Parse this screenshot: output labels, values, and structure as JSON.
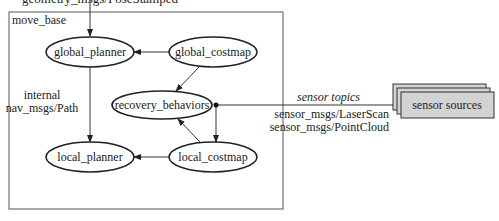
{
  "container": {
    "label": "move_base"
  },
  "top_input": {
    "label": "geometry_msgs/PoseStamped"
  },
  "nodes": {
    "global_planner": "global_planner",
    "global_costmap": "global_costmap",
    "recovery_behaviors": "recovery_behaviors",
    "local_planner": "local_planner",
    "local_costmap": "local_costmap"
  },
  "path_label": {
    "line1": "internal",
    "line2": "nav_msgs/Path"
  },
  "sensor": {
    "topics_title": "sensor topics",
    "topic1": "sensor_msgs/LaserScan",
    "topic2": "sensor_msgs/PointCloud",
    "sources_label": "sensor sources",
    "fill": "#d3d3d3"
  }
}
